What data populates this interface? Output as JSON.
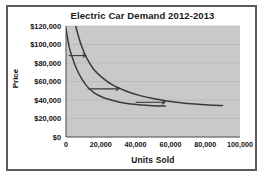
{
  "chart_data": {
    "type": "line",
    "title": "Electric Car Demand 2012-2013",
    "xlabel": "Units Sold",
    "ylabel": "Price",
    "xlim": [
      0,
      100000
    ],
    "ylim": [
      0,
      120000
    ],
    "grid": true,
    "legend": "inline-curve-labels",
    "plot_background": "#c9c9c9",
    "line_color": "#3a3a3a",
    "frame_color": "#5c5c5c",
    "xticks": [
      "0",
      "20,000",
      "40,000",
      "60,000",
      "80,000",
      "100,000"
    ],
    "xtick_values": [
      0,
      20000,
      40000,
      60000,
      80000,
      100000
    ],
    "yticks": [
      "$0",
      "$20,000",
      "$40,000",
      "$60,000",
      "$80,000",
      "$100,000",
      "$120,000"
    ],
    "ytick_values": [
      0,
      20000,
      40000,
      60000,
      80000,
      100000,
      120000
    ],
    "series": [
      {
        "name": "2012",
        "label": "2012",
        "points": [
          [
            0,
            117000
          ],
          [
            2000,
            96000
          ],
          [
            4000,
            84000
          ],
          [
            6000,
            74000
          ],
          [
            9000,
            63000
          ],
          [
            12000,
            55000
          ],
          [
            16000,
            48000
          ],
          [
            21000,
            43000
          ],
          [
            27000,
            39500
          ],
          [
            34000,
            36500
          ],
          [
            42000,
            34800
          ],
          [
            50000,
            33800
          ],
          [
            57000,
            33400
          ]
        ]
      },
      {
        "name": "2013",
        "label": "2013",
        "points": [
          [
            5000,
            124000
          ],
          [
            7000,
            110000
          ],
          [
            9000,
            98000
          ],
          [
            12000,
            85000
          ],
          [
            16000,
            73000
          ],
          [
            21000,
            64000
          ],
          [
            27000,
            56000
          ],
          [
            34000,
            50000
          ],
          [
            42000,
            45000
          ],
          [
            50000,
            41500
          ],
          [
            58000,
            39000
          ],
          [
            66000,
            37000
          ],
          [
            74000,
            35600
          ],
          [
            82000,
            34600
          ],
          [
            90000,
            34000
          ]
        ]
      }
    ],
    "annotations": [
      {
        "name": "shift-arrow-high",
        "from": [
          1500,
          88000
        ],
        "to": [
          11500,
          88000
        ]
      },
      {
        "name": "shift-arrow-mid",
        "from": [
          12500,
          52000
        ],
        "to": [
          30500,
          52000
        ]
      },
      {
        "name": "shift-arrow-low",
        "from": [
          40000,
          37500
        ],
        "to": [
          57000,
          37500
        ]
      }
    ]
  }
}
